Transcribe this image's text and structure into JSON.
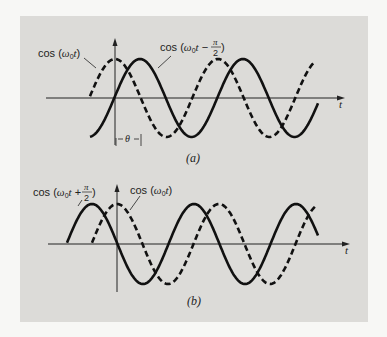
{
  "figure": {
    "panel_a": {
      "caption": "(a)",
      "label_dashed": "cos (ω0t)",
      "label_solid": "cos (ω0t − π/2)",
      "phase_label": "θ",
      "axis_label": "t"
    },
    "panel_b": {
      "caption": "(b)",
      "label_solid": "cos (ω0t + π/2)",
      "label_dashed": "cos (ω0t)",
      "axis_label": "t"
    },
    "colors": {
      "background": "#dcdbd8",
      "ink": "#111111"
    }
  }
}
